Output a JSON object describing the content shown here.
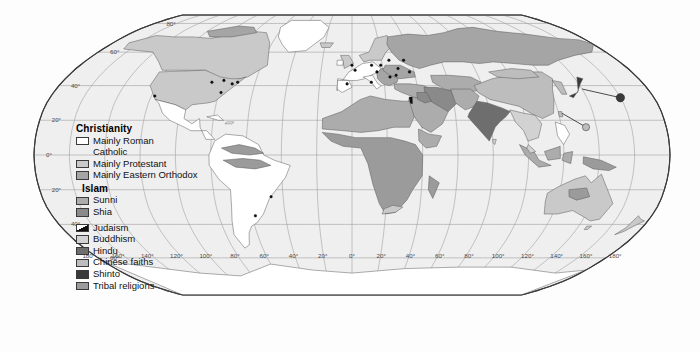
{
  "map": {
    "projection": "Robinson",
    "title": "World religions",
    "ocean_color": "#efefef",
    "graticule_color": "#9a9a9a",
    "border_color": "#3c3c3c",
    "coast_color": "#555555"
  },
  "legend": {
    "groups": [
      {
        "heading": "Christianity",
        "heading_bold": true,
        "items": [
          {
            "label": "Mainly Roman",
            "label2": "Catholic",
            "color": "#ffffff",
            "swatch": "solid"
          },
          {
            "label": "Mainly Protestant",
            "color": "#c9c9c9",
            "swatch": "solid"
          },
          {
            "label": "Mainly Eastern Orthodox",
            "color": "#a5a5a5",
            "swatch": "solid"
          }
        ]
      },
      {
        "heading": "Islam",
        "heading_bold": true,
        "items": [
          {
            "label": "Sunni",
            "color": "#acacac",
            "swatch": "solid"
          },
          {
            "label": "Shia",
            "color": "#8a8a8a",
            "swatch": "solid"
          }
        ]
      },
      {
        "heading": "",
        "heading_bold": false,
        "items": [
          {
            "label": "Judaism",
            "color": "#111111",
            "swatch": "diagonal"
          },
          {
            "label": "Buddhism",
            "color": "#d2d2d2",
            "swatch": "solid"
          },
          {
            "label": "Hindu",
            "color": "#6e6e6e",
            "swatch": "solid"
          },
          {
            "label": "Chinese faiths",
            "color": "#bdbdbd",
            "swatch": "solid"
          },
          {
            "label": "Shinto",
            "color": "#3a3a3a",
            "swatch": "solid"
          },
          {
            "label": "Tribal religions",
            "color": "#9b9b9b",
            "swatch": "solid"
          }
        ]
      }
    ]
  },
  "graticule": {
    "longitude_labels": [
      "180°",
      "160°",
      "140°",
      "120°",
      "100°",
      "80°",
      "60°",
      "40°",
      "20°",
      "0°",
      "20°",
      "40°",
      "60°",
      "80°",
      "100°",
      "120°",
      "140°",
      "160°",
      "180°"
    ],
    "latitude_labels_left": [
      "80°",
      "60°",
      "40°",
      "20°",
      "0°",
      "20°",
      "40°",
      "60°"
    ],
    "latitude_values": [
      80,
      60,
      40,
      20,
      0,
      -20,
      -40,
      -60
    ],
    "longitude_values": [
      -180,
      -160,
      -140,
      -120,
      -100,
      -80,
      -60,
      -40,
      -20,
      0,
      20,
      40,
      60,
      80,
      100,
      120,
      140,
      160,
      180
    ],
    "interval_lon": 20,
    "interval_lat": 20
  }
}
